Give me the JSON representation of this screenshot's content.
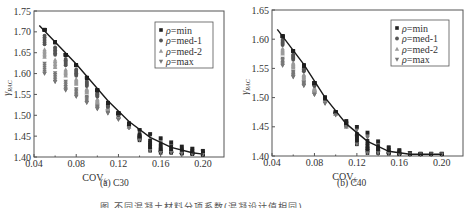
{
  "figure_caption": "图 不同混凝土材料分项系数(混凝设计值相同)",
  "chart_data": [
    {
      "type": "scatter",
      "title": "(a) C30",
      "xlabel": "COV_fc",
      "ylabel": "γ_RAC",
      "xlim": [
        0.04,
        0.22
      ],
      "ylim": [
        1.4,
        1.75
      ],
      "xticks": [
        "0.04",
        "0.08",
        "0.12",
        "0.16",
        "0.20"
      ],
      "yticks": [
        "1.40",
        "1.45",
        "1.50",
        "1.55",
        "1.60",
        "1.65",
        "1.70",
        "1.75"
      ],
      "grid": false,
      "legend_position": "upper right",
      "legend": [
        "ρ=min",
        "ρ=med-1",
        "ρ=med-2",
        "ρ=max"
      ],
      "x": [
        0.05,
        0.06,
        0.07,
        0.08,
        0.09,
        0.1,
        0.11,
        0.12,
        0.13,
        0.14,
        0.15,
        0.16,
        0.17,
        0.18,
        0.19,
        0.2
      ],
      "series": [
        {
          "name": "ρ=min",
          "values": [
            1.705,
            1.675,
            1.645,
            1.62,
            1.59,
            1.56,
            1.53,
            1.505,
            1.48,
            1.44,
            1.415,
            1.41,
            1.41,
            1.408,
            1.407,
            1.405
          ]
        },
        {
          "name": "ρ=med-1",
          "values": [
            1.67,
            1.645,
            1.62,
            1.595,
            1.57,
            1.545,
            1.52,
            1.5,
            1.475,
            1.45,
            1.43,
            1.415,
            1.412,
            1.41,
            1.408,
            1.406
          ]
        },
        {
          "name": "ρ=med-2",
          "values": [
            1.64,
            1.615,
            1.595,
            1.575,
            1.555,
            1.53,
            1.515,
            1.495,
            1.472,
            1.458,
            1.445,
            1.425,
            1.418,
            1.412,
            1.41,
            1.408
          ]
        },
        {
          "name": "ρ=max",
          "values": [
            1.6,
            1.58,
            1.56,
            1.545,
            1.53,
            1.515,
            1.505,
            1.49,
            1.47,
            1.465,
            1.455,
            1.445,
            1.435,
            1.425,
            1.42,
            1.415
          ]
        }
      ],
      "fit_line": {
        "x": [
          0.045,
          0.08,
          0.11,
          0.13,
          0.15,
          0.17,
          0.19,
          0.2
        ],
        "y": [
          1.715,
          1.623,
          1.535,
          1.485,
          1.447,
          1.423,
          1.41,
          1.407
        ]
      }
    },
    {
      "type": "scatter",
      "title": "(b) C40",
      "xlabel": "COV_fc",
      "ylabel": "γ_RAC",
      "xlim": [
        0.04,
        0.22
      ],
      "ylim": [
        1.4,
        1.65
      ],
      "xticks": [
        "0.04",
        "0.08",
        "0.12",
        "0.16",
        "0.20"
      ],
      "yticks": [
        "1.40",
        "1.45",
        "1.50",
        "1.55",
        "1.60",
        "1.65"
      ],
      "grid": false,
      "legend_position": "upper right",
      "legend": [
        "ρ=min",
        "ρ=med-1",
        "ρ=med-2",
        "ρ=max"
      ],
      "x": [
        0.05,
        0.06,
        0.07,
        0.08,
        0.09,
        0.1,
        0.11,
        0.12,
        0.13,
        0.14,
        0.15,
        0.16,
        0.17,
        0.18,
        0.19,
        0.2
      ],
      "series": [
        {
          "name": "ρ=min",
          "values": [
            1.605,
            1.58,
            1.555,
            1.525,
            1.5,
            1.475,
            1.455,
            1.42,
            1.405,
            1.405,
            1.404,
            1.403,
            1.403,
            1.403,
            1.403,
            1.403
          ]
        },
        {
          "name": "ρ=med-1",
          "values": [
            1.59,
            1.565,
            1.545,
            1.52,
            1.497,
            1.474,
            1.452,
            1.435,
            1.415,
            1.41,
            1.406,
            1.404,
            1.403,
            1.403,
            1.403,
            1.403
          ]
        },
        {
          "name": "ρ=med-2",
          "values": [
            1.575,
            1.552,
            1.532,
            1.512,
            1.494,
            1.472,
            1.45,
            1.44,
            1.425,
            1.415,
            1.408,
            1.405,
            1.404,
            1.403,
            1.403,
            1.403
          ]
        },
        {
          "name": "ρ=max",
          "values": [
            1.555,
            1.535,
            1.52,
            1.505,
            1.49,
            1.47,
            1.46,
            1.45,
            1.44,
            1.425,
            1.415,
            1.41,
            1.405,
            1.404,
            1.404,
            1.404
          ]
        }
      ],
      "fit_line": {
        "x": [
          0.045,
          0.07,
          0.09,
          0.11,
          0.13,
          0.15,
          0.17,
          0.2
        ],
        "y": [
          1.617,
          1.557,
          1.5,
          1.455,
          1.425,
          1.408,
          1.403,
          1.403
        ]
      }
    }
  ],
  "panels": [
    {
      "caption_prefix": "(a) ",
      "caption_grade": "C30"
    },
    {
      "caption_prefix": "(b) ",
      "caption_grade": "C40"
    }
  ],
  "colors": {
    "axis": "#555555",
    "fit_line": "#1a1a1a",
    "min": "#222222",
    "med1": "#555555",
    "med2": "#9a9a9a",
    "max": "#777777"
  }
}
